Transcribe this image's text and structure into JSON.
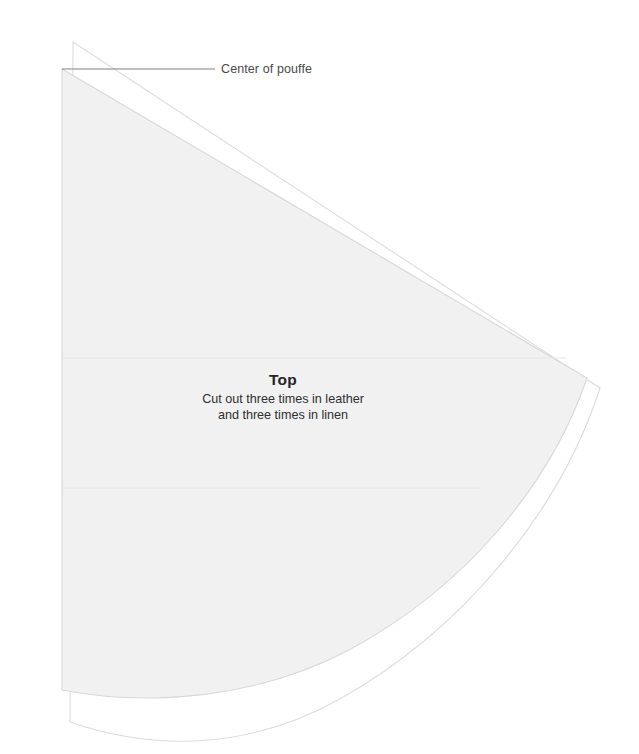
{
  "document": {
    "type": "sewing-pattern-diagram",
    "background_color": "#ffffff",
    "width": 639,
    "height": 754
  },
  "annotations": {
    "center_marker": {
      "label": "Center of pouffe",
      "leader_line": {
        "from_x": 62,
        "from_y": 69,
        "to_x": 215,
        "to_y": 69,
        "color": "#808080"
      },
      "label_color": "#4a4a4a"
    }
  },
  "piece": {
    "title": "Top",
    "instructions": {
      "line1": "Cut out three times in leather",
      "line2": "and three times in linen"
    },
    "fill_color": "#f1f1f1",
    "stroke_color": "#d8d8d8",
    "seam_allowance_stroke": "#dcdcdc",
    "seam_line_color": "#e6e6e6"
  },
  "geometry": {
    "fabric_wedge": {
      "apex_x": 62,
      "apex_y": 69,
      "left_edge_bottom_x": 62,
      "left_edge_bottom_y": 690,
      "right_tip_x": 587,
      "right_tip_y": 378,
      "arc_description": "quarter-circle arc from right tip to bottom-left"
    },
    "seam_allowance_outline": {
      "apex_x": 73,
      "apex_y": 42,
      "left_edge_bottom_x": 70,
      "left_edge_bottom_y": 722,
      "right_tip_x": 600,
      "right_tip_y": 388
    },
    "internal_seam_lines": [
      {
        "y": 358,
        "label": "upper-seam-line"
      },
      {
        "y": 488,
        "label": "lower-seam-line"
      }
    ]
  }
}
